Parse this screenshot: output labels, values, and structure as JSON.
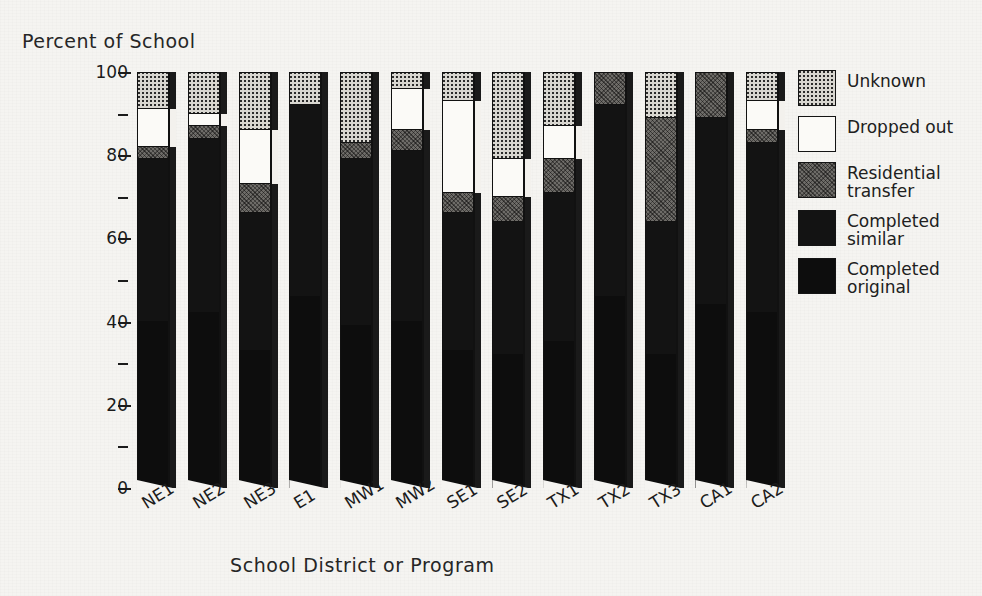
{
  "chart_data": {
    "type": "bar",
    "subtype": "stacked-bar-100-percent",
    "title": "",
    "xlabel": "School District or Program",
    "ylabel": "Percent of School",
    "ylim": [
      0,
      100
    ],
    "ytick_values": [
      0,
      20,
      40,
      60,
      80,
      100
    ],
    "ytick_labels": [
      "0",
      "20",
      "40",
      "60",
      "80",
      "100"
    ],
    "yminor_values": [
      10,
      30,
      50,
      70,
      90
    ],
    "grid": false,
    "legend_position": "right",
    "categories": [
      "NE1",
      "NE2",
      "NE3",
      "E1",
      "MW1",
      "MW2",
      "SE1",
      "SE2",
      "TX1",
      "TX2",
      "TX3",
      "CA1",
      "CA2"
    ],
    "series": [
      {
        "name": "Completed original",
        "key": "original",
        "color": "#0d0d0d",
        "values": [
          40,
          42,
          33,
          46,
          39,
          40,
          33,
          32,
          35,
          46,
          32,
          44,
          42
        ]
      },
      {
        "name": "Completed similar",
        "key": "similar",
        "color": "#131313",
        "values": [
          39,
          42,
          33,
          46,
          40,
          41,
          33,
          32,
          36,
          46,
          32,
          45,
          41
        ]
      },
      {
        "name": "Residential transfer",
        "key": "residential",
        "color": "#6e6c68",
        "values": [
          3,
          3,
          7,
          0,
          4,
          5,
          5,
          6,
          8,
          8,
          25,
          11,
          3
        ]
      },
      {
        "name": "Dropped out",
        "key": "dropped",
        "color": "#fbfaf7",
        "values": [
          9,
          3,
          13,
          0,
          0,
          10,
          22,
          9,
          8,
          0,
          0,
          0,
          7
        ]
      },
      {
        "name": "Unknown",
        "key": "unknown",
        "color": "#d8d6d0",
        "values": [
          9,
          10,
          14,
          8,
          17,
          4,
          7,
          21,
          13,
          0,
          11,
          0,
          7
        ]
      }
    ],
    "stack_order_bottom_to_top": [
      "original",
      "similar",
      "residential",
      "dropped",
      "unknown"
    ],
    "annotations": []
  },
  "legend": {
    "items": [
      {
        "label": "Unknown",
        "swatch": "dotted-gray-swatch"
      },
      {
        "label": "Dropped out",
        "swatch": "white-swatch"
      },
      {
        "label": "Residential\ntransfer",
        "swatch": "textured-gray-swatch"
      },
      {
        "label": "Completed\nsimilar",
        "swatch": "black-swatch"
      },
      {
        "label": "Completed\noriginal",
        "swatch": "black-swatch"
      }
    ]
  }
}
